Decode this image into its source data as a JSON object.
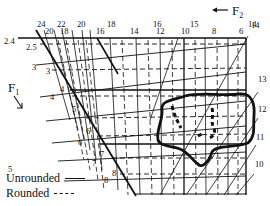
{
  "figure": {
    "force_labels": {
      "f1": "F",
      "f1_sub": "1",
      "f2": "F",
      "f2_sub": "2"
    },
    "top_labels_outer": [
      "24",
      "22",
      "20",
      "18",
      "16",
      "15",
      "14"
    ],
    "top_labels_inner": [
      "20",
      "18",
      "16",
      "14",
      "12",
      "10",
      "8",
      "6"
    ],
    "left_labels_outer": [
      "2.4",
      "3",
      "4",
      "5",
      "6",
      "7",
      "8"
    ],
    "left_labels_inner": [
      "2.5",
      "3",
      "4",
      "5",
      "6",
      "7",
      "8"
    ],
    "right_labels": [
      "14",
      "13",
      "12",
      "11",
      "10"
    ],
    "legend": [
      {
        "label": "Unrounded",
        "style": "solid"
      },
      {
        "label": "Rounded",
        "style": "dashed"
      }
    ]
  }
}
